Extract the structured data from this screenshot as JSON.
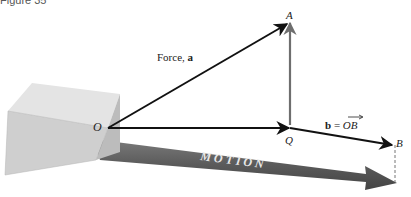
{
  "caption": "Figure 35",
  "labels": {
    "force": "Force, ",
    "force_vec": "a",
    "origin": "O",
    "point_a": "A",
    "point_q": "Q",
    "point_b": "B",
    "b_eq_left": "b",
    "b_eq_mid": " = ",
    "b_eq_right": "OB",
    "motion": "MOTION"
  },
  "colors": {
    "vector": "#111111",
    "projection": "#6e6e6e",
    "motion_arrow": "#5e5e5e",
    "box_top": "#e4e4e4",
    "box_front": "#cfcfcf",
    "box_side": "#bdbdbd"
  }
}
